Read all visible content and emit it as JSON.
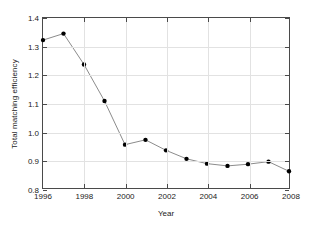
{
  "chart_data": {
    "type": "line",
    "title": "",
    "xlabel": "Year",
    "ylabel": "Total matching efficiency",
    "x": [
      1996,
      1997,
      1998,
      1999,
      2000,
      2001,
      2002,
      2003,
      2004,
      2005,
      2006,
      2007,
      2008
    ],
    "values": [
      1.322,
      1.345,
      1.236,
      1.107,
      0.953,
      0.97,
      0.933,
      0.903,
      0.886,
      0.878,
      0.884,
      0.893,
      0.859
    ],
    "series": [
      {
        "name": "Total matching efficiency",
        "values": [
          1.322,
          1.345,
          1.236,
          1.107,
          0.953,
          0.97,
          0.933,
          0.903,
          0.886,
          0.878,
          0.884,
          0.893,
          0.859
        ]
      }
    ],
    "xlim": [
      1996,
      2008
    ],
    "ylim": [
      0.8,
      1.4
    ],
    "xticks": [
      1996,
      1998,
      2000,
      2002,
      2004,
      2006,
      2008
    ],
    "xtick_labels": [
      "1996",
      "1998",
      "2000",
      "2002",
      "2004",
      "2006",
      "2008"
    ],
    "yticks": [
      0.8,
      0.9,
      1.0,
      1.1,
      1.2,
      1.3,
      1.4
    ],
    "ytick_labels": [
      "0.8",
      "0.9",
      "1.0",
      "1.1",
      "1.2",
      "1.3",
      "1.4"
    ],
    "grid": true,
    "legend": false,
    "legend_position": "none",
    "marker": "filled-circle",
    "marker_color": "#000000",
    "line_color": "#7d7d7d",
    "grid_color": "#e2e2e2",
    "axis_color": "#4a4a4a",
    "background_color": "#ffffff"
  }
}
